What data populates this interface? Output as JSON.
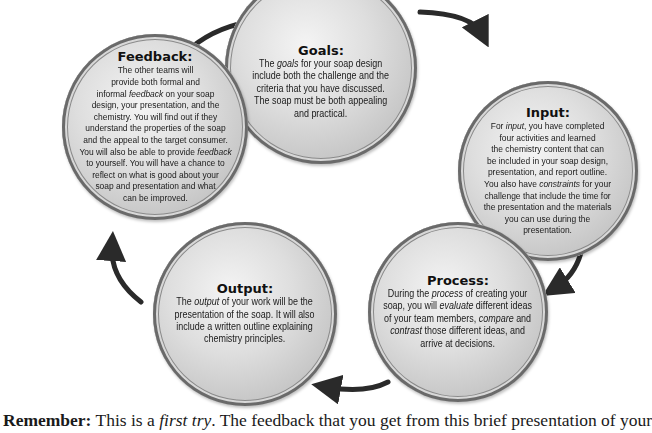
{
  "diagram": {
    "type": "cycle",
    "nodes": [
      {
        "id": "goals",
        "title": "Goals:",
        "lines": [
          [
            {
              "t": "The "
            },
            {
              "t": "goals",
              "i": true
            },
            {
              "t": " for your soap design"
            }
          ],
          [
            {
              "t": "include both the challenge and the"
            }
          ],
          [
            {
              "t": "criteria that you have discussed."
            }
          ],
          [
            {
              "t": "The soap must be both appealing"
            }
          ],
          [
            {
              "t": "and practical."
            }
          ]
        ]
      },
      {
        "id": "input",
        "title": "Input:",
        "lines": [
          [
            {
              "t": "For "
            },
            {
              "t": "input",
              "i": true
            },
            {
              "t": ", you have completed"
            }
          ],
          [
            {
              "t": "four activities and learned"
            }
          ],
          [
            {
              "t": "the chemistry content that can"
            }
          ],
          [
            {
              "t": "be included in your soap design,"
            }
          ],
          [
            {
              "t": "presentation, and report outline."
            }
          ],
          [
            {
              "t": "You also have "
            },
            {
              "t": "constraints",
              "i": true
            },
            {
              "t": " for your"
            }
          ],
          [
            {
              "t": "challenge that include the time for"
            }
          ],
          [
            {
              "t": "the presentation and the materials"
            }
          ],
          [
            {
              "t": "you can use during the"
            }
          ],
          [
            {
              "t": "presentation."
            }
          ]
        ]
      },
      {
        "id": "process",
        "title": "Process:",
        "lines": [
          [
            {
              "t": "During the "
            },
            {
              "t": "process",
              "i": true
            },
            {
              "t": " of creating your"
            }
          ],
          [
            {
              "t": "soap, you will "
            },
            {
              "t": "evaluate",
              "i": true
            },
            {
              "t": " different ideas"
            }
          ],
          [
            {
              "t": "of your team members, "
            },
            {
              "t": "compare",
              "i": true
            },
            {
              "t": " and"
            }
          ],
          [
            {
              "t": "contrast",
              "i": true
            },
            {
              "t": " those different ideas, and"
            }
          ],
          [
            {
              "t": "arrive at decisions."
            }
          ]
        ]
      },
      {
        "id": "output",
        "title": "Output:",
        "lines": [
          [
            {
              "t": "The "
            },
            {
              "t": "output",
              "i": true
            },
            {
              "t": " of your work will be the"
            }
          ],
          [
            {
              "t": "presentation of the soap. It will also"
            }
          ],
          [
            {
              "t": "include a written outline explaining"
            }
          ],
          [
            {
              "t": "chemistry principles."
            }
          ]
        ]
      },
      {
        "id": "feedback",
        "title": "Feedback:",
        "lines": [
          [
            {
              "t": "The other teams will"
            }
          ],
          [
            {
              "t": "provide both formal and"
            }
          ],
          [
            {
              "t": "informal "
            },
            {
              "t": "feedback",
              "i": true
            },
            {
              "t": " on your soap"
            }
          ],
          [
            {
              "t": "design, your presentation, and the"
            }
          ],
          [
            {
              "t": "chemistry. You will find out if they"
            }
          ],
          [
            {
              "t": "understand the properties of the soap"
            }
          ],
          [
            {
              "t": "and the appeal to the target consumer."
            }
          ],
          [
            {
              "t": "You will also be able to provide "
            },
            {
              "t": "feedback",
              "i": true
            }
          ],
          [
            {
              "t": "to yourself. You will have a chance to"
            }
          ],
          [
            {
              "t": "reflect on what is good about your"
            }
          ],
          [
            {
              "t": "soap and presentation and what"
            }
          ],
          [
            {
              "t": "can be improved."
            }
          ]
        ]
      }
    ],
    "edges": [
      {
        "from": "feedback",
        "to": "goals"
      },
      {
        "from": "goals",
        "to": "input"
      },
      {
        "from": "input",
        "to": "process"
      },
      {
        "from": "process",
        "to": "output"
      },
      {
        "from": "output",
        "to": "feedback"
      }
    ]
  },
  "footer": {
    "label": "Remember:",
    "text_before": " This is a ",
    "italic": "first try",
    "text_after": ". The feedback that you get from this brief presentation of your"
  },
  "colors": {
    "arrow": "#2a2a2a",
    "text": "#1a1a1a",
    "circle_fill": "#d4d4d4"
  }
}
